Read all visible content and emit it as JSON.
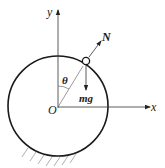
{
  "diagram": {
    "type": "free-body diagram",
    "axes": {
      "x_label": "x",
      "y_label": "y",
      "origin_label": "O"
    },
    "forces": {
      "normal_label": "N",
      "gravity_label": "mg"
    },
    "angle_label": "θ",
    "elements": [
      "circular track",
      "small ring (bead) on track",
      "ground hatching"
    ],
    "colors": {
      "line": "#1a1a1a",
      "axis": "#333333",
      "hatch": "#9a9a9a"
    }
  }
}
